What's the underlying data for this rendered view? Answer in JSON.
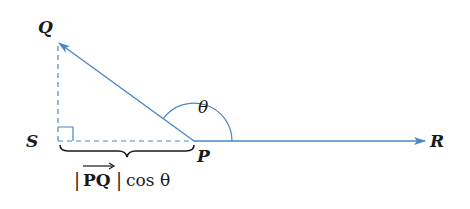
{
  "diagram": {
    "colors": {
      "vector": "#4a86c5",
      "text": "#1a1a1a"
    },
    "points": {
      "Q": {
        "label": "Q"
      },
      "S": {
        "label": "S"
      },
      "P": {
        "label": "P"
      },
      "R": {
        "label": "R"
      }
    },
    "angle_label": "θ",
    "brace_label": {
      "bar_left": "|",
      "vector": "PQ",
      "bar_right": "|",
      "func": "cos",
      "arg": "θ"
    },
    "elements": [
      "vector-PQ (solid arrow from P to Q)",
      "vector-PR (solid arrow from P to R)",
      "dashed segment QS",
      "dashed segment SP",
      "right-angle marker at S",
      "angle arc θ at P",
      "underbrace S to P"
    ]
  }
}
